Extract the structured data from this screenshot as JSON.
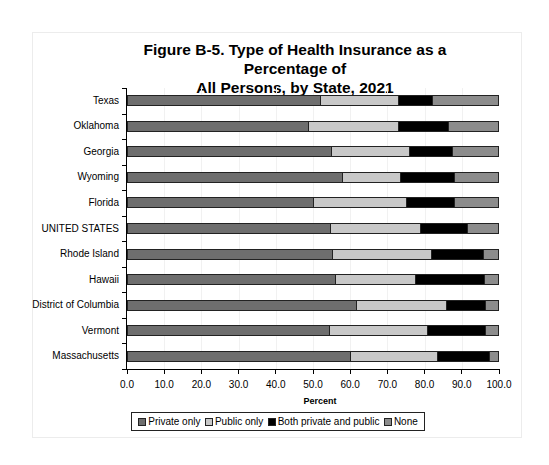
{
  "chart_data": {
    "type": "bar",
    "orientation": "horizontal",
    "stacked": true,
    "title": "Figure B-5. Type of Health Insurance as a Percentage of All Persons, by State, 2021",
    "title_lines": [
      "Figure B-5. Type of Health Insurance as a Percentage of",
      "All Persons, by State, 2021"
    ],
    "xlabel": "Percent",
    "ylabel": "",
    "xlim": [
      0,
      100
    ],
    "x_ticks": [
      "0.0",
      "10.0",
      "20.0",
      "30.0",
      "40.0",
      "50.0",
      "60.0",
      "70.0",
      "80.0",
      "90.0",
      "100.0"
    ],
    "grid": true,
    "legend_position": "bottom",
    "categories": [
      "Texas",
      "Oklahoma",
      "Georgia",
      "Wyoming",
      "Florida",
      "UNITED STATES",
      "Rhode Island",
      "Hawaii",
      "District of Columbia",
      "Vermont",
      "Massachusetts"
    ],
    "series": [
      {
        "name": "Private only",
        "color": "#6e6e6e",
        "values": [
          52.2,
          48.9,
          55.1,
          58.1,
          50.3,
          54.8,
          55.4,
          56.2,
          61.8,
          54.6,
          60.2
        ]
      },
      {
        "name": "Public only",
        "color": "#c8c8c8",
        "values": [
          20.9,
          24.2,
          21.0,
          15.6,
          25.0,
          24.2,
          26.6,
          21.5,
          24.2,
          26.3,
          23.4
        ]
      },
      {
        "name": "Both private and public",
        "color": "#000000",
        "values": [
          9.2,
          13.5,
          11.5,
          14.5,
          12.9,
          12.7,
          14.0,
          18.5,
          10.5,
          15.6,
          14.0
        ]
      },
      {
        "name": "None",
        "color": "#8c8c8c",
        "values": [
          17.7,
          13.4,
          12.4,
          11.8,
          11.8,
          8.3,
          4.0,
          3.8,
          3.5,
          3.5,
          2.4
        ]
      }
    ]
  }
}
